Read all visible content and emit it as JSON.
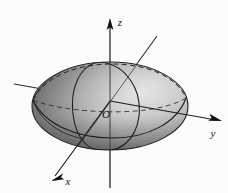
{
  "figure": {
    "kind": "3d-ellipsoid-diagram",
    "background_color": "#fcfcfc",
    "stroke_color": "#1a1a1a",
    "surface_light_color": "#dcdcdc",
    "surface_mid_color": "#a8a8a8",
    "surface_dark_color": "#6e6e6e",
    "surface_shadow_color": "#555555"
  },
  "axes": {
    "z": {
      "label": "z",
      "label_x": 120,
      "label_y": 26,
      "arrow_tip_x": 110,
      "arrow_tip_y": 19,
      "line_x1": 110,
      "line_y1": 22,
      "line_x2": 110,
      "line_y2": 188
    },
    "y": {
      "label": "y",
      "label_x": 213,
      "label_y": 136,
      "arrow_tip_x": 222,
      "arrow_tip_y": 120,
      "line_x1": 14,
      "line_y1": 84,
      "line_x2": 220,
      "line_y2": 120
    },
    "x": {
      "label": "x",
      "label_x": 67,
      "label_y": 184,
      "arrow_tip_x": 52,
      "arrow_tip_y": 178,
      "line_x1": 157,
      "line_y1": 36,
      "line_x2": 54,
      "line_y2": 177
    }
  },
  "origin": {
    "label": "O",
    "label_x": 106,
    "label_y": 117,
    "x": 110,
    "y": 113
  },
  "ellipsoid": {
    "center_x": 110,
    "center_y": 106,
    "radius_x": 78,
    "radius_y": 44,
    "outline_note": "silhouette ellipse of the ellipsoid surface"
  },
  "traces": {
    "equator_front_visible": true,
    "equator_back_dashed": true,
    "vertical_trace_visible": true,
    "meridian_left_visible": true
  }
}
